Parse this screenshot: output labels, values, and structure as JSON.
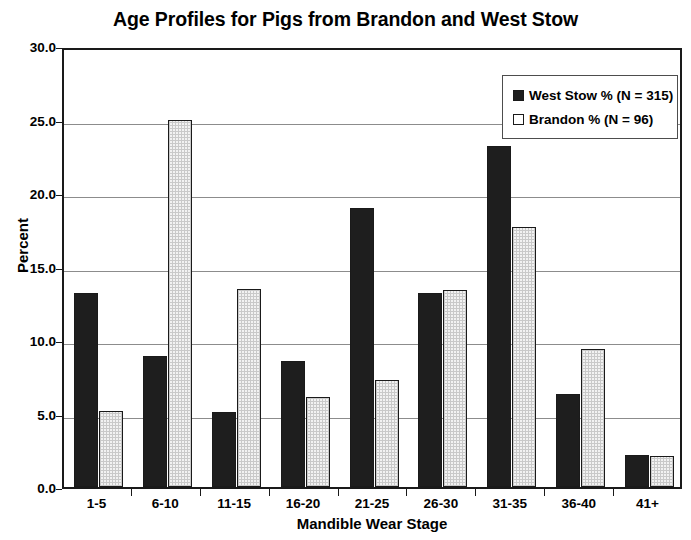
{
  "chart_data": {
    "type": "bar",
    "title": "Age Profiles for Pigs from Brandon and West Stow",
    "xlabel": "Mandible Wear Stage",
    "ylabel": "Percent",
    "categories": [
      "1-5",
      "6-10",
      "11-15",
      "16-20",
      "21-25",
      "26-30",
      "31-35",
      "36-40",
      "41+"
    ],
    "series": [
      {
        "name": "West Stow % (N = 315)",
        "color": "#1e1e1e",
        "values": [
          13.2,
          8.9,
          5.1,
          8.6,
          19.0,
          13.2,
          23.2,
          6.3,
          2.2
        ]
      },
      {
        "name": "Brandon % (N = 96)",
        "color": "#f2f2f2",
        "values": [
          5.2,
          25.0,
          13.5,
          6.1,
          7.3,
          13.4,
          17.7,
          9.4,
          2.1
        ]
      }
    ],
    "ylim": [
      0.0,
      30.0
    ],
    "ytick_labels": [
      "0.0",
      "5.0",
      "10.0",
      "15.0",
      "20.0",
      "25.0",
      "30.0"
    ],
    "ytick_values": [
      0,
      5,
      10,
      15,
      20,
      25,
      30
    ],
    "grid": "horizontal",
    "legend_position": "top-right",
    "legend_entries": [
      {
        "label": "West Stow % (N = 315)",
        "swatch": "filled-black-square"
      },
      {
        "label": "Brandon % (N = 96)",
        "swatch": "open-white-square"
      }
    ]
  }
}
